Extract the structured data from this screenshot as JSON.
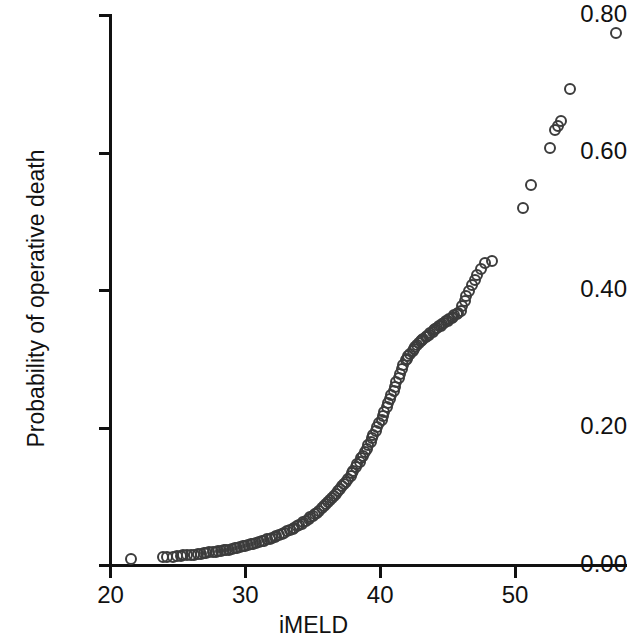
{
  "chart_data": {
    "type": "scatter",
    "title": "",
    "xlabel": "iMELD",
    "ylabel": "Probability of operative death",
    "xlim": [
      18.5,
      58.6
    ],
    "ylim": [
      -0.018,
      0.822
    ],
    "grid": false,
    "legend": null,
    "xticks": [
      20,
      30,
      40,
      50
    ],
    "xtick_labels": [
      "20",
      "30",
      "40",
      "50"
    ],
    "yticks": [
      0.0,
      0.2,
      0.4,
      0.6,
      0.8
    ],
    "ytick_labels": [
      "0.00",
      "0.20",
      "0.40",
      "0.60",
      "0.80"
    ],
    "marker": "open-circle",
    "marker_color": "#3c3c3c",
    "axis_color": "#111111",
    "x": [
      21.5,
      23.9,
      24.2,
      24.6,
      24.9,
      25.2,
      25.4,
      25.7,
      26.0,
      26.2,
      26.5,
      26.7,
      26.9,
      27.1,
      27.3,
      27.6,
      27.8,
      28.0,
      28.2,
      28.4,
      28.6,
      28.8,
      29.0,
      29.2,
      29.4,
      29.6,
      29.8,
      30.0,
      30.2,
      30.4,
      30.6,
      30.8,
      31.0,
      31.2,
      31.4,
      31.6,
      31.8,
      32.0,
      32.2,
      32.3,
      32.5,
      32.7,
      32.9,
      33.1,
      33.3,
      33.5,
      33.6,
      33.8,
      34.0,
      34.2,
      34.3,
      34.5,
      34.7,
      34.8,
      35.0,
      35.2,
      35.3,
      35.5,
      35.7,
      35.8,
      36.0,
      36.1,
      36.3,
      36.4,
      36.6,
      36.7,
      36.9,
      37.0,
      37.2,
      37.3,
      37.5,
      37.6,
      37.8,
      37.9,
      38.0,
      38.2,
      38.3,
      38.5,
      38.6,
      38.7,
      38.9,
      39.0,
      39.1,
      39.3,
      39.4,
      39.5,
      39.7,
      39.8,
      39.9,
      40.1,
      40.2,
      40.3,
      40.5,
      40.6,
      40.7,
      40.8,
      41.0,
      41.1,
      41.2,
      41.4,
      41.5,
      41.6,
      41.7,
      41.9,
      42.0,
      42.1,
      42.2,
      42.4,
      42.5,
      42.6,
      42.7,
      42.9,
      43.0,
      43.1,
      43.2,
      43.4,
      43.5,
      43.6,
      43.7,
      43.9,
      44.0,
      44.1,
      44.2,
      44.4,
      44.5,
      44.6,
      44.7,
      44.9,
      45.0,
      45.1,
      45.3,
      45.4,
      45.5,
      45.7,
      45.8,
      46.0,
      46.1,
      46.3,
      46.4,
      46.6,
      46.8,
      47.0,
      47.2,
      47.5,
      47.8,
      48.3,
      50.6,
      51.2,
      52.6,
      53.0,
      53.2,
      53.4,
      54.1,
      57.5
    ],
    "y": [
      0.01,
      0.012,
      0.013,
      0.013,
      0.014,
      0.014,
      0.015,
      0.015,
      0.016,
      0.016,
      0.017,
      0.017,
      0.018,
      0.018,
      0.019,
      0.019,
      0.02,
      0.021,
      0.021,
      0.022,
      0.023,
      0.023,
      0.024,
      0.025,
      0.026,
      0.027,
      0.028,
      0.029,
      0.03,
      0.031,
      0.032,
      0.033,
      0.034,
      0.035,
      0.036,
      0.038,
      0.039,
      0.04,
      0.042,
      0.043,
      0.045,
      0.046,
      0.048,
      0.05,
      0.051,
      0.053,
      0.055,
      0.057,
      0.059,
      0.061,
      0.063,
      0.065,
      0.068,
      0.07,
      0.072,
      0.075,
      0.077,
      0.08,
      0.083,
      0.086,
      0.089,
      0.092,
      0.095,
      0.098,
      0.101,
      0.104,
      0.108,
      0.111,
      0.115,
      0.119,
      0.122,
      0.126,
      0.13,
      0.134,
      0.138,
      0.143,
      0.147,
      0.151,
      0.156,
      0.16,
      0.165,
      0.17,
      0.175,
      0.18,
      0.185,
      0.19,
      0.196,
      0.201,
      0.207,
      0.212,
      0.218,
      0.224,
      0.23,
      0.236,
      0.242,
      0.248,
      0.254,
      0.26,
      0.267,
      0.273,
      0.279,
      0.286,
      0.292,
      0.299,
      0.3,
      0.305,
      0.308,
      0.312,
      0.315,
      0.318,
      0.321,
      0.323,
      0.326,
      0.328,
      0.33,
      0.332,
      0.334,
      0.336,
      0.338,
      0.34,
      0.342,
      0.344,
      0.346,
      0.348,
      0.349,
      0.351,
      0.353,
      0.355,
      0.356,
      0.358,
      0.36,
      0.362,
      0.364,
      0.366,
      0.368,
      0.37,
      0.378,
      0.385,
      0.392,
      0.4,
      0.408,
      0.415,
      0.423,
      0.432,
      0.44,
      0.443,
      0.52,
      0.553,
      0.608,
      0.634,
      0.64,
      0.646,
      0.693,
      0.775
    ]
  }
}
